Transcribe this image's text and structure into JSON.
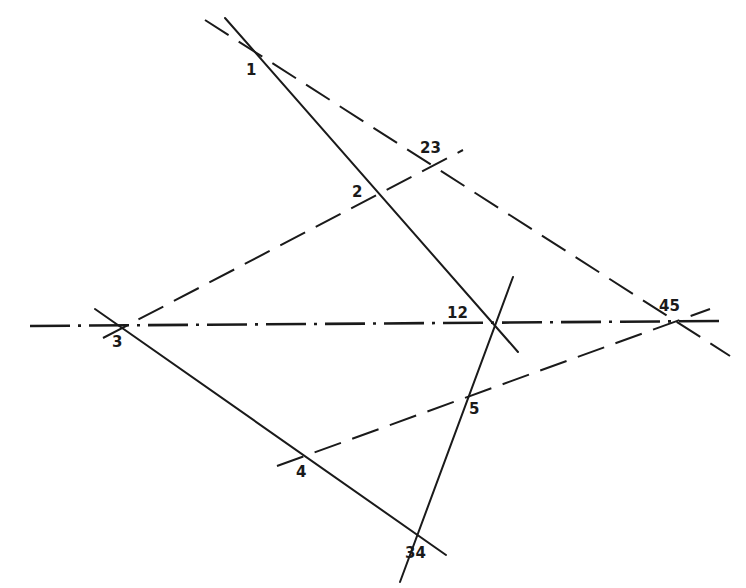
{
  "diagram": {
    "colors": {
      "ink": "#1a1a1a",
      "background": "#ffffff"
    },
    "lines": [
      {
        "id": "line-1-12",
        "style": "solid",
        "x1": 225,
        "y1": 18,
        "x2": 518,
        "y2": 352
      },
      {
        "id": "line-1-23-45",
        "style": "dashed",
        "x1": 205,
        "y1": 20,
        "x2": 730,
        "y2": 356
      },
      {
        "id": "line-3-2-23",
        "style": "dashed",
        "x1": 103,
        "y1": 338,
        "x2": 463,
        "y2": 150
      },
      {
        "id": "axis-3-12-45",
        "style": "dashdot",
        "x1": 30,
        "y1": 326,
        "x2": 722,
        "y2": 321
      },
      {
        "id": "line-3-4-34",
        "style": "solid",
        "x1": 95,
        "y1": 309,
        "x2": 446,
        "y2": 555
      },
      {
        "id": "line-4-5-45",
        "style": "dashed",
        "x1": 277,
        "y1": 466,
        "x2": 710,
        "y2": 309
      },
      {
        "id": "line-12-5-34",
        "style": "solid",
        "x1": 513,
        "y1": 277,
        "x2": 400,
        "y2": 582
      }
    ],
    "labels": [
      {
        "text": "1",
        "x": 246,
        "y": 75
      },
      {
        "text": "23",
        "x": 420,
        "y": 153
      },
      {
        "text": "2",
        "x": 352,
        "y": 197
      },
      {
        "text": "3",
        "x": 112,
        "y": 347
      },
      {
        "text": "12",
        "x": 447,
        "y": 318
      },
      {
        "text": "45",
        "x": 659,
        "y": 311
      },
      {
        "text": "5",
        "x": 469,
        "y": 414
      },
      {
        "text": "4",
        "x": 296,
        "y": 477
      },
      {
        "text": "34",
        "x": 405,
        "y": 558
      }
    ]
  }
}
